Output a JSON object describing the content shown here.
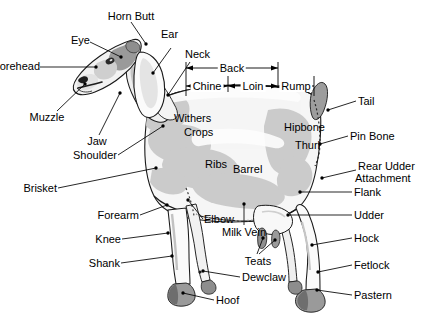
{
  "diagram": {
    "background_color": "#ffffff",
    "line_color": "#000000",
    "body_fill": "#f4f4f4",
    "body_shade": "#c9c9c9",
    "hoof_color": "#8a8a8a",
    "dark_accent": "#5a5a5a"
  },
  "labels": {
    "horn_butt": "Horn Butt",
    "eye": "Eye",
    "ear": "Ear",
    "neck": "Neck",
    "forehead": "Forehead",
    "muzzle": "Muzzle",
    "jaw": "Jaw",
    "shoulder": "Shoulder",
    "brisket": "Brisket",
    "forearm": "Forearm",
    "knee": "Knee",
    "shank": "Shank",
    "hoof_front": "Hoof",
    "dewclaw": "Dewclaw",
    "elbow": "Elbow",
    "milk_vein": "Milk Vein",
    "teats": "Teats",
    "withers": "Withers",
    "crops": "Crops",
    "ribs": "Ribs",
    "barrel": "Barrel",
    "hipbone": "Hipbone",
    "thurl": "Thurl",
    "tail": "Tail",
    "pin_bone": "Pin Bone",
    "rear_udder_attachment_line1": "Rear Udder",
    "rear_udder_attachment_line2": "Attachment",
    "flank": "Flank",
    "udder": "Udder",
    "hock": "Hock",
    "fetlock": "Fetlock",
    "pastern": "Pastern"
  },
  "dimension_bars": {
    "back": "Back",
    "chine": "Chine",
    "loin": "Loin",
    "rump": "Rump"
  }
}
